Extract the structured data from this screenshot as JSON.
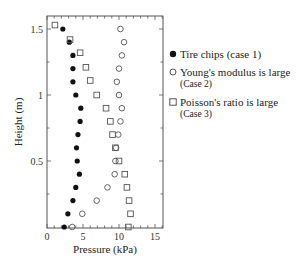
{
  "chart_data": {
    "type": "scatter",
    "title": "",
    "xlabel": "Pressure (kPa)",
    "ylabel": "Height (m)",
    "xlim": [
      0,
      16
    ],
    "ylim": [
      0,
      1.6
    ],
    "xticks": [
      0,
      5,
      10,
      15
    ],
    "yticks": [
      0.5,
      1,
      1.5
    ],
    "xtick_labels": [
      "0",
      "5",
      "10",
      "15"
    ],
    "ytick_labels": [
      "0.5",
      "1",
      "1.5"
    ],
    "grid": false,
    "legend_position": "right",
    "series": [
      {
        "name": "Tire chips (case 1)",
        "marker": "filled-circle",
        "points": [
          [
            2.2,
            1.5
          ],
          [
            3.1,
            1.4
          ],
          [
            3.6,
            1.3
          ],
          [
            3.6,
            1.2
          ],
          [
            3.6,
            1.1
          ],
          [
            4.0,
            1.0
          ],
          [
            4.7,
            0.9
          ],
          [
            4.6,
            0.8
          ],
          [
            4.3,
            0.7
          ],
          [
            4.1,
            0.6
          ],
          [
            4.2,
            0.5
          ],
          [
            4.5,
            0.4
          ],
          [
            4.0,
            0.3
          ],
          [
            3.6,
            0.2
          ],
          [
            2.9,
            0.1
          ],
          [
            2.4,
            0.0
          ]
        ]
      },
      {
        "name": "Young's modulus is large (Case 2)",
        "marker": "open-circle",
        "points": [
          [
            10.2,
            1.5
          ],
          [
            10.7,
            1.4
          ],
          [
            10.4,
            1.3
          ],
          [
            10.0,
            1.2
          ],
          [
            9.7,
            1.1
          ],
          [
            10.0,
            1.0
          ],
          [
            10.4,
            0.9
          ],
          [
            10.2,
            0.8
          ],
          [
            9.9,
            0.7
          ],
          [
            9.6,
            0.6
          ],
          [
            9.5,
            0.5
          ],
          [
            9.4,
            0.4
          ],
          [
            8.4,
            0.3
          ],
          [
            6.9,
            0.2
          ],
          [
            4.9,
            0.1
          ],
          [
            3.5,
            0.0
          ]
        ]
      },
      {
        "name": "Poisson's ratio is large (Case 3)",
        "marker": "open-square",
        "points": [
          [
            1.1,
            1.53
          ],
          [
            3.2,
            1.42
          ],
          [
            4.6,
            1.32
          ],
          [
            5.4,
            1.21
          ],
          [
            6.0,
            1.11
          ],
          [
            6.9,
            1.0
          ],
          [
            8.2,
            0.9
          ],
          [
            8.8,
            0.8
          ],
          [
            9.1,
            0.7
          ],
          [
            9.5,
            0.6
          ],
          [
            10.0,
            0.5
          ],
          [
            10.8,
            0.4
          ],
          [
            11.1,
            0.3
          ],
          [
            11.4,
            0.2
          ],
          [
            11.6,
            0.1
          ],
          [
            11.3,
            0.0
          ]
        ]
      }
    ]
  },
  "legend": {
    "items": [
      {
        "label": "Tire chips (case 1)",
        "sub": ""
      },
      {
        "label": "Young's modulus is large",
        "sub": "(Case 2)"
      },
      {
        "label": "Poisson's ratio is large",
        "sub": "(Case 3)"
      }
    ]
  },
  "axes": {
    "xlabel": "Pressure (kPa)",
    "ylabel": "Height (m)"
  }
}
